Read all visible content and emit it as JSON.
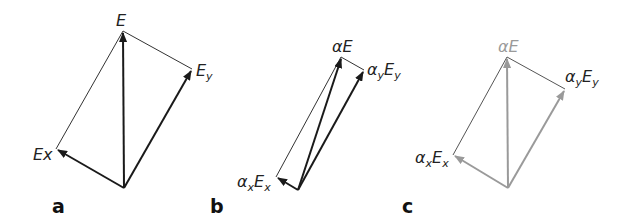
{
  "figure": {
    "panels": [
      {
        "id": "a",
        "label": "a",
        "vectors": {
          "resultant": {
            "label": "E"
          },
          "x_component": {
            "label": "Ex"
          },
          "y_component": {
            "label_main": "E",
            "label_sub": "y"
          }
        },
        "color": "#1a1a1a"
      },
      {
        "id": "b",
        "label": "b",
        "vectors": {
          "resultant": {
            "label": "αE"
          },
          "x_component": {
            "label_main": "α",
            "label_sub1": "x",
            "label_main2": "E",
            "label_sub2": "x"
          },
          "y_component": {
            "label_main": "α",
            "label_sub1": "y",
            "label_main2": "E",
            "label_sub2": "y"
          }
        },
        "color": "#1a1a1a"
      },
      {
        "id": "c",
        "label": "c",
        "vectors": {
          "resultant": {
            "label": "αE"
          },
          "x_component": {
            "label_main": "α",
            "label_sub1": "x",
            "label_main2": "E",
            "label_sub2": "x"
          },
          "y_component": {
            "label_main": "α",
            "label_sub1": "y",
            "label_main2": "E",
            "label_sub2": "y"
          }
        },
        "color": "#9a9a9a"
      }
    ]
  }
}
